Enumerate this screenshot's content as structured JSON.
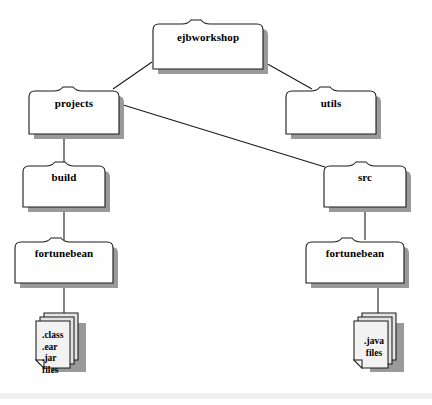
{
  "diagram": {
    "type": "tree",
    "colors": {
      "folder_fill": "#fefefe",
      "folder_stroke": "#1a1a1a",
      "shadow": "#9a9a9a",
      "document_fill": "#f2f2f2",
      "document_back": "#e4e4e4",
      "edge": "#1a1a1a",
      "background": "#ffffff"
    },
    "nodes": [
      {
        "id": "ejbworkshop",
        "label": "ejbworkshop",
        "kind": "folder",
        "x": 152,
        "y": 18,
        "w": 112,
        "h": 52
      },
      {
        "id": "projects",
        "label": "projects",
        "kind": "folder",
        "x": 28,
        "y": 85,
        "w": 92,
        "h": 50
      },
      {
        "id": "utils",
        "label": "utils",
        "kind": "folder",
        "x": 285,
        "y": 85,
        "w": 92,
        "h": 50
      },
      {
        "id": "build",
        "label": "build",
        "kind": "folder",
        "x": 22,
        "y": 160,
        "w": 84,
        "h": 48
      },
      {
        "id": "src",
        "label": "src",
        "kind": "folder",
        "x": 323,
        "y": 160,
        "w": 84,
        "h": 48
      },
      {
        "id": "fortunebean-build",
        "label": "fortunebean",
        "kind": "folder",
        "x": 14,
        "y": 236,
        "w": 100,
        "h": 48
      },
      {
        "id": "fortunebean-src",
        "label": "fortunebean",
        "kind": "folder",
        "x": 305,
        "y": 236,
        "w": 100,
        "h": 48
      },
      {
        "id": "class-files",
        "label": ".class\n.ear\n.jar\nfiles",
        "kind": "documents",
        "x": 30,
        "y": 310,
        "w": 62,
        "h": 66
      },
      {
        "id": "java-files",
        "label": ".java\nfiles",
        "kind": "documents",
        "x": 348,
        "y": 310,
        "w": 62,
        "h": 66
      }
    ],
    "edges": [
      {
        "from": "ejbworkshop",
        "to": "projects"
      },
      {
        "from": "ejbworkshop",
        "to": "utils"
      },
      {
        "from": "projects",
        "to": "build"
      },
      {
        "from": "projects",
        "to": "src"
      },
      {
        "from": "build",
        "to": "fortunebean-build"
      },
      {
        "from": "src",
        "to": "fortunebean-src"
      },
      {
        "from": "fortunebean-build",
        "to": "class-files"
      },
      {
        "from": "fortunebean-src",
        "to": "java-files"
      }
    ]
  }
}
